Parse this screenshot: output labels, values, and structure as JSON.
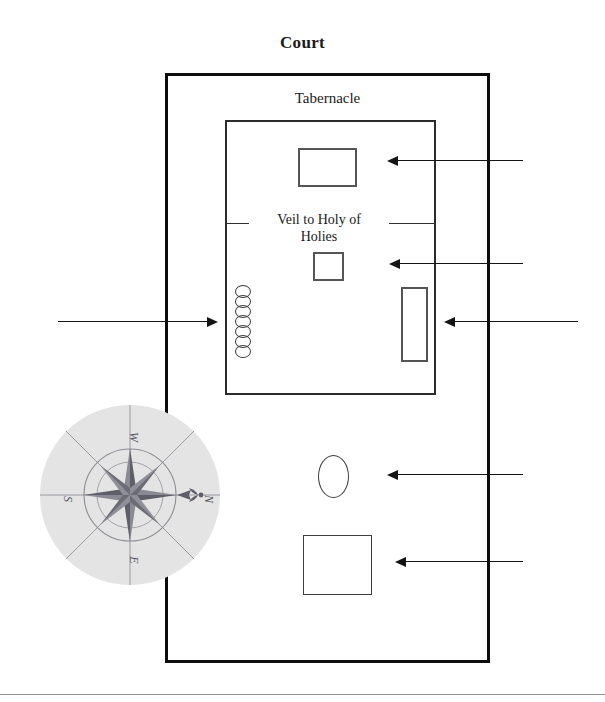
{
  "page": {
    "background_color": "#ffffff",
    "width": 605,
    "height": 702
  },
  "labels": {
    "court_title": "Court",
    "tabernacle_title": "Tabernacle",
    "veil_line1": "Veil to Holy of",
    "veil_line2": "Holies"
  },
  "enclosures": [
    {
      "name": "court",
      "label": "Court",
      "stroke_color": "#0d0d0d",
      "stroke_width": 3,
      "x": 165,
      "y": 73,
      "width": 325,
      "height": 590
    },
    {
      "name": "tabernacle",
      "label": "Tabernacle",
      "stroke_color": "#2b2b2b",
      "stroke_width": 2,
      "x": 225,
      "y": 120,
      "width": 211,
      "height": 275
    }
  ],
  "furniture": [
    {
      "name": "ark-of-the-covenant",
      "shape": "rectangle",
      "x": 298,
      "y": 148,
      "width": 59,
      "height": 39,
      "stroke_color": "#555555"
    },
    {
      "name": "altar-of-incense",
      "shape": "rectangle",
      "x": 313,
      "y": 252,
      "width": 31,
      "height": 29,
      "stroke_color": "#555555"
    },
    {
      "name": "table-of-showbread",
      "shape": "rectangle",
      "x": 401,
      "y": 287,
      "width": 27,
      "height": 75,
      "stroke_color": "#545454"
    },
    {
      "name": "lampstand",
      "shape": "circle-column",
      "x": 235,
      "y": 285,
      "circle_count": 7,
      "circle_width": 16,
      "circle_height": 13,
      "circle_spacing": 10,
      "stroke_color": "#3a3a3a"
    },
    {
      "name": "laver",
      "shape": "ellipse",
      "x": 318,
      "y": 455,
      "width": 31,
      "height": 43,
      "stroke_color": "#3d3d3d"
    },
    {
      "name": "altar-of-burnt-offering",
      "shape": "rectangle",
      "x": 303,
      "y": 535,
      "width": 69,
      "height": 60,
      "stroke_color": "#3d3d3d"
    }
  ],
  "veil": {
    "label_line1": "Veil to Holy of",
    "label_line2": "Holies",
    "left_segment": {
      "x": 227,
      "y": 223,
      "width": 22
    },
    "right_segment": {
      "x": 389,
      "y": 223,
      "width": 47
    },
    "stroke_color": "#2e2e2e"
  },
  "arrows": [
    {
      "name": "arrow-to-ark",
      "direction": "left",
      "tail_x": 523,
      "head_x": 387,
      "y": 160,
      "stroke_color": "#141414"
    },
    {
      "name": "arrow-to-incense",
      "direction": "left",
      "tail_x": 523,
      "head_x": 389,
      "y": 263,
      "stroke_color": "#141414"
    },
    {
      "name": "arrow-to-table",
      "direction": "left",
      "tail_x": 578,
      "head_x": 444,
      "y": 321,
      "stroke_color": "#141414"
    },
    {
      "name": "arrow-to-lampstand",
      "direction": "right",
      "tail_x": 58,
      "head_x": 218,
      "y": 321,
      "stroke_color": "#141414"
    },
    {
      "name": "arrow-to-laver",
      "direction": "left",
      "tail_x": 523,
      "head_x": 387,
      "y": 474,
      "stroke_color": "#141414"
    },
    {
      "name": "arrow-to-altar",
      "direction": "left",
      "tail_x": 523,
      "head_x": 395,
      "y": 561,
      "stroke_color": "#141414"
    }
  ],
  "compass": {
    "name": "compass-rose",
    "x": 39,
    "y": 404,
    "size": 182,
    "rotation_degrees": 90,
    "disc_color": "#e4e4e4",
    "ink_color": "#6f6f77",
    "cardinals": {
      "top": "W",
      "right": "N",
      "bottom": "E",
      "left": "S"
    }
  },
  "footer": {
    "rule_color": "#8e8e8e",
    "rule_y": 694
  }
}
